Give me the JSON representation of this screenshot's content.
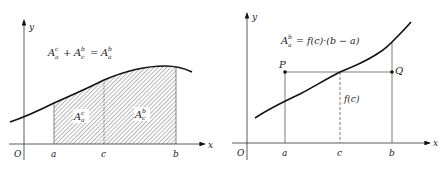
{
  "left_diagram": {
    "axis_x_label": "x",
    "axis_y_label": "y",
    "origin_label": "O",
    "ticks": {
      "a": "a",
      "c": "c",
      "b": "b"
    },
    "formula": {
      "term1_base": "A",
      "term1_sup": "c",
      "term1_sub": "a",
      "plus": "+",
      "term2_base": "A",
      "term2_sup": "b",
      "term2_sub": "c",
      "equals": "=",
      "term3_base": "A",
      "term3_sup": "b",
      "term3_sub": "a"
    },
    "region_left": {
      "base": "A",
      "sup": "c",
      "sub": "a"
    },
    "region_right": {
      "base": "A",
      "sup": "b",
      "sub": "c"
    },
    "colors": {
      "hatch": "#777777",
      "curve": "#111111",
      "axis": "#333333"
    }
  },
  "right_diagram": {
    "axis_x_label": "x",
    "axis_y_label": "y",
    "origin_label": "O",
    "ticks": {
      "a": "a",
      "c": "c",
      "b": "b"
    },
    "point_p": "P",
    "point_q": "Q",
    "fc_label": "f(c)",
    "formula": {
      "lhs_base": "A",
      "lhs_sup": "b",
      "lhs_sub": "a",
      "rhs": "= f(c)·(b − a)"
    },
    "colors": {
      "curve": "#111111",
      "axis": "#333333",
      "lines": "#444444"
    }
  }
}
